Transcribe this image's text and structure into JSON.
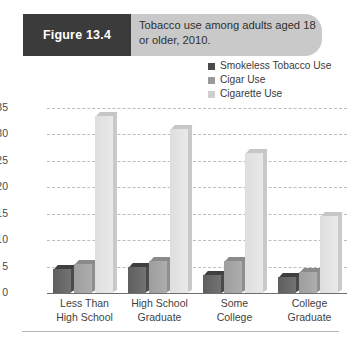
{
  "figure": {
    "number_label": "Figure 13.4",
    "caption": "Tobacco use among adults aged 18 or older, 2010."
  },
  "legend": {
    "position": "top-right",
    "items": [
      {
        "label": "Smokeless Tobacco Use",
        "color": "#4a4a4a"
      },
      {
        "label": "Cigar Use",
        "color": "#9a9a9a"
      },
      {
        "label": "Cigarette Use",
        "color": "#cfcfcf"
      }
    ]
  },
  "chart_data": {
    "type": "bar",
    "title": "Tobacco use among adults aged 18 or older, 2010.",
    "xlabel": "",
    "ylabel": "Percent Use",
    "ylim": [
      0,
      35
    ],
    "yticks": [
      0,
      5,
      10,
      15,
      20,
      25,
      30,
      35
    ],
    "grid": true,
    "legend_position": "top-right",
    "categories": [
      "Less Than High School",
      "High School Graduate",
      "Some College",
      "College Graduate"
    ],
    "category_lines": [
      [
        "Less Than",
        "High School"
      ],
      [
        "High School",
        "Graduate"
      ],
      [
        "Some",
        "College"
      ],
      [
        "College",
        "Graduate"
      ]
    ],
    "series": [
      {
        "name": "Smokeless Tobacco Use",
        "color": "#4a4a4a",
        "values": [
          4.5,
          5.0,
          3.5,
          3.0
        ]
      },
      {
        "name": "Cigar Use",
        "color": "#9a9a9a",
        "values": [
          5.5,
          6.0,
          6.0,
          4.0
        ]
      },
      {
        "name": "Cigarette Use",
        "color": "#cfcfcf",
        "values": [
          33.5,
          31.0,
          26.5,
          14.5
        ]
      }
    ]
  }
}
